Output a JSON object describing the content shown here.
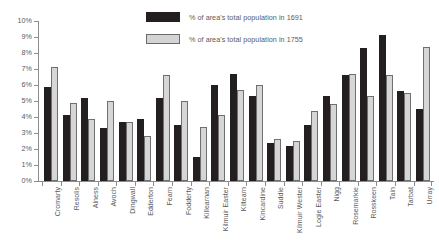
{
  "chart_data": {
    "type": "bar",
    "title": "",
    "xlabel": "",
    "ylabel": "",
    "ylim": [
      0,
      10
    ],
    "ytick_labels": [
      "10%",
      "9%",
      "8%",
      "7%",
      "6%",
      "5%",
      "4%",
      "3%",
      "2%",
      "1%",
      "0%"
    ],
    "ytick_values": [
      10,
      9,
      8,
      7,
      6,
      5,
      4,
      3,
      2,
      1,
      0
    ],
    "grid": false,
    "legend_position": "top-center",
    "categories": [
      "Cromarty",
      "Resolis",
      "Alness",
      "Avoch",
      "Dingwall",
      "Edderton",
      "Fearn",
      "Fodderty",
      "Killearnan",
      "Kilmuir Easter",
      "Kiltearn",
      "Kincardine",
      "Suddie",
      "Kilmuir Wester",
      "Logie Easter",
      "Nigg",
      "Rosemarkie",
      "Rosskeen",
      "Tain",
      "Tarbat",
      "Urray"
    ],
    "series": [
      {
        "name": "% of area's total population in 1691",
        "color": "#231f20",
        "values": [
          5.9,
          4.1,
          5.2,
          3.3,
          3.7,
          3.9,
          5.2,
          3.5,
          1.5,
          6.0,
          6.7,
          5.3,
          2.4,
          2.2,
          3.5,
          5.3,
          6.6,
          8.3,
          9.1,
          5.6,
          4.5
        ]
      },
      {
        "name": "% of area's total population in 1755",
        "color": "#d6d6d6",
        "values": [
          7.1,
          4.9,
          3.9,
          5.0,
          3.7,
          2.8,
          6.6,
          5.0,
          3.4,
          4.1,
          5.7,
          6.0,
          2.6,
          2.5,
          4.4,
          4.8,
          6.7,
          5.3,
          6.6,
          5.5,
          8.4
        ]
      }
    ]
  },
  "legend": {
    "items": [
      {
        "label": "% of area's total population in 1691",
        "swatch": "black-swatch"
      },
      {
        "label": "% of area's total population in 1755",
        "swatch": "gray-swatch"
      }
    ]
  }
}
